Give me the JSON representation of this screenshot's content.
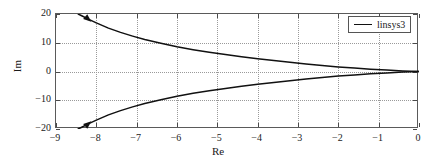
{
  "chart_data": {
    "type": "line",
    "title": "",
    "xlabel": "Re",
    "ylabel": "Im",
    "xlim": [
      -9,
      0
    ],
    "ylim": [
      -20,
      20
    ],
    "xticks": [
      -9,
      -8,
      -7,
      -6,
      -5,
      -4,
      -3,
      -2,
      -1,
      0
    ],
    "xtick_labels": [
      "−9",
      "−8",
      "−7",
      "−6",
      "−5",
      "−4",
      "−3",
      "−2",
      "−1",
      "0"
    ],
    "yticks": [
      -20,
      -10,
      0,
      10,
      20
    ],
    "ytick_labels": [
      "−20",
      "−10",
      "0",
      "10",
      "20"
    ],
    "grid": true,
    "grid_style": "dotted",
    "grid_color": "#9a9a9a",
    "legend": {
      "position": "top-right",
      "entries": [
        "linsys3"
      ]
    },
    "line_color": "#111111",
    "series": [
      {
        "name": "linsys3-upper-branch",
        "comment": "root-locus upper branch, arrow marker near (-8.2, 18)",
        "x": [
          -8.45,
          -8.35,
          -8.2,
          -8.0,
          -7.7,
          -7.4,
          -7.1,
          -6.8,
          -6.4,
          -6.0,
          -5.6,
          -5.2,
          -4.8,
          -4.4,
          -4.0,
          -3.6,
          -3.2,
          -2.8,
          -2.4,
          -2.0,
          -1.6,
          -1.2,
          -0.8,
          -0.4,
          0.0
        ],
        "y": [
          20.0,
          19.3,
          18.2,
          16.9,
          15.1,
          13.6,
          12.3,
          11.1,
          9.8,
          8.6,
          7.6,
          6.7,
          5.9,
          5.1,
          4.4,
          3.8,
          3.2,
          2.6,
          2.1,
          1.6,
          1.2,
          0.8,
          0.5,
          0.2,
          0.0
        ]
      },
      {
        "name": "linsys3-lower-branch",
        "comment": "root-locus lower branch, arrow marker near (-8.2, -18)",
        "x": [
          -8.45,
          -8.35,
          -8.2,
          -8.0,
          -7.7,
          -7.4,
          -7.1,
          -6.8,
          -6.4,
          -6.0,
          -5.6,
          -5.2,
          -4.8,
          -4.4,
          -4.0,
          -3.6,
          -3.2,
          -2.8,
          -2.4,
          -2.0,
          -1.6,
          -1.2,
          -0.8,
          -0.4,
          0.0
        ],
        "y": [
          -20.0,
          -19.3,
          -18.2,
          -16.9,
          -15.1,
          -13.6,
          -12.3,
          -11.1,
          -9.8,
          -8.6,
          -7.6,
          -6.7,
          -5.9,
          -5.1,
          -4.4,
          -3.8,
          -3.2,
          -2.6,
          -2.1,
          -1.6,
          -1.2,
          -0.8,
          -0.5,
          -0.2,
          0.0
        ]
      }
    ],
    "markers": [
      {
        "name": "arrow-upper",
        "x": -8.2,
        "y": 18.2,
        "type": "arrowhead"
      },
      {
        "name": "arrow-lower",
        "x": -8.2,
        "y": -18.2,
        "type": "arrowhead"
      }
    ]
  },
  "axes": {
    "x_title": "Re",
    "y_title": "Im"
  },
  "legend": {
    "label": "linsys3"
  }
}
